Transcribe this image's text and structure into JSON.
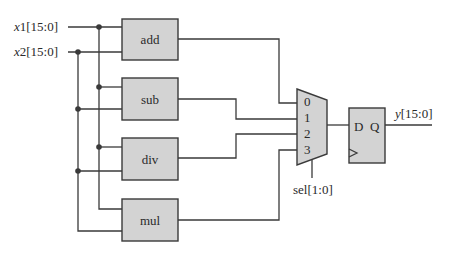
{
  "diagram": {
    "inputs": [
      {
        "name_italic": "x",
        "name_rest": "1[15:0]"
      },
      {
        "name_italic": "x",
        "name_rest": "2[15:0]"
      }
    ],
    "blocks": [
      {
        "label": "add"
      },
      {
        "label": "sub"
      },
      {
        "label": "div"
      },
      {
        "label": "mul"
      }
    ],
    "mux": {
      "ports": [
        "0",
        "1",
        "2",
        "3"
      ],
      "select_label": "sel[1:0]"
    },
    "register": {
      "d_label": "D",
      "q_label": "Q"
    },
    "output": {
      "name_italic": "y",
      "name_rest": "[15:0]"
    },
    "colors": {
      "block_fill": "#d3d3d3",
      "line": "#3a3a3a"
    }
  }
}
